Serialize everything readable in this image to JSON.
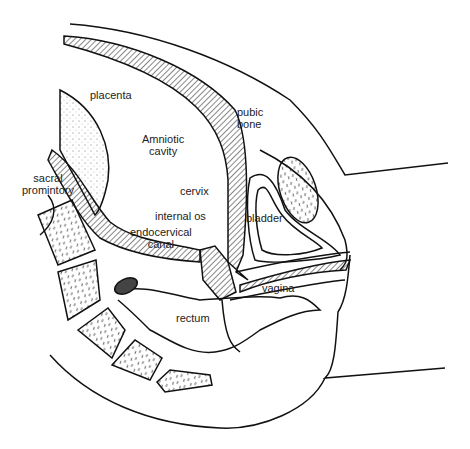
{
  "diagram": {
    "type": "anatomical sagittal section",
    "labels": {
      "placenta": "placenta",
      "amniotic_line1": "Amniotic",
      "amniotic_line2": "cavity",
      "pubic_line1": "pubic",
      "pubic_line2": "bone",
      "sacral_line1": "sacral",
      "sacral_line2": "promintory",
      "cervix": "cervix",
      "internal_os": "internal os",
      "endo_line1": "endocervical",
      "endo_line2": "canal",
      "bladder": "bladder",
      "vagina": "vagina",
      "rectum": "rectum"
    },
    "colors": {
      "stroke": "#111111",
      "background": "#ffffff"
    }
  }
}
